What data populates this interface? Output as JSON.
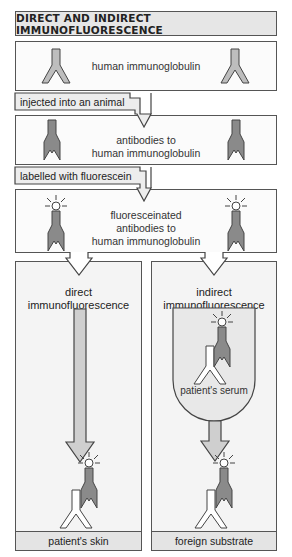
{
  "title": "DIRECT AND INDIRECT IMMUNOFLUORESCENCE",
  "steps": [
    {
      "id": "step-1",
      "label": "human immunoglobulin"
    },
    {
      "id": "step-2",
      "label_lines": [
        "antibodies to",
        "human immunoglobulin"
      ]
    },
    {
      "id": "step-3",
      "label_lines": [
        "fluoresceinated",
        "antibodies to",
        "human immunoglobulin"
      ]
    }
  ],
  "transitions": [
    {
      "id": "transition-1",
      "label": "injected into an animal"
    },
    {
      "id": "transition-2",
      "label": "labelled with fluorescein"
    }
  ],
  "panels": {
    "direct": {
      "title_lines": [
        "direct",
        "immunofluorescence"
      ],
      "base_label": "patient's skin"
    },
    "indirect": {
      "title_lines": [
        "indirect",
        "immunofluorescence"
      ],
      "serum_label": "patient's serum",
      "base_label": "foreign substrate"
    }
  },
  "colors": {
    "antibody_light": "#bdbdbd",
    "antibody_dark": "#8a8a8a",
    "panel_bg": "#f4f4f4",
    "serum_bg": "#e8e8e8",
    "outline": "#555555"
  }
}
